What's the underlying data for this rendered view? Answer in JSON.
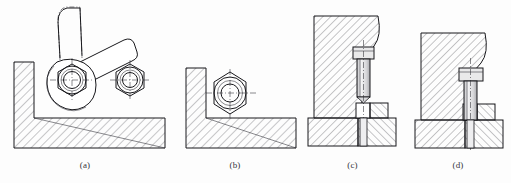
{
  "figure": {
    "background_color": "#fdfdfd",
    "line_color": "#18181c",
    "hatch_color": "#43434a",
    "metal_fill_color": "#e9e9ea",
    "panel_count": 4
  },
  "panels": [
    {
      "id": "a",
      "caption": "(a)",
      "description": "Swing clamp lever with hex nut on L-shaped bracket, phantom outline of alternate handle position",
      "elements": [
        {
          "name": "handle-shaft",
          "type": "phantom-outline"
        },
        {
          "name": "lever-arm",
          "type": "solid-band"
        },
        {
          "name": "clamp-hub-nut",
          "type": "hex-nut-with-circles"
        },
        {
          "name": "second-hex-nut",
          "type": "hex-nut-with-circles"
        },
        {
          "name": "l-bracket",
          "type": "hatched-section"
        }
      ]
    },
    {
      "id": "b",
      "caption": "(b)",
      "description": "L-shaped bracket section with single hex nut seated in the inner corner",
      "elements": [
        {
          "name": "hex-nut",
          "type": "hex-nut-with-circles"
        },
        {
          "name": "l-bracket",
          "type": "hatched-section"
        }
      ]
    },
    {
      "id": "c",
      "caption": "(c)",
      "description": "Hex head bolt raised in clearance slot of hatched fixture block over base plate",
      "elements": [
        {
          "name": "fixture-block",
          "type": "hatched-section"
        },
        {
          "name": "hex-head-bolt",
          "type": "bolt-upper-position"
        },
        {
          "name": "clamp-pad",
          "type": "hatched-section"
        },
        {
          "name": "base-plate",
          "type": "hatched-section"
        }
      ]
    },
    {
      "id": "d",
      "caption": "(d)",
      "description": "Hex head bolt lowered into notch of hatched fixture block over base plate",
      "elements": [
        {
          "name": "fixture-block",
          "type": "hatched-section"
        },
        {
          "name": "hex-head-bolt",
          "type": "bolt-lower-position"
        },
        {
          "name": "clamp-pad",
          "type": "hatched-section"
        },
        {
          "name": "base-plate",
          "type": "hatched-section"
        }
      ]
    }
  ]
}
